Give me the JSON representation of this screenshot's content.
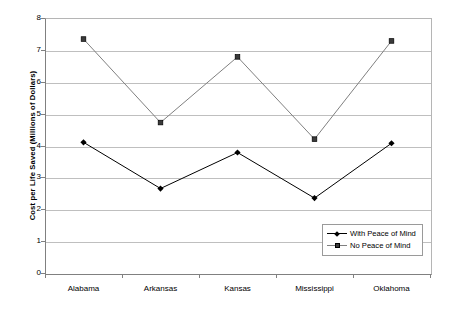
{
  "chart_data": {
    "type": "line",
    "title": "",
    "xlabel": "",
    "ylabel": "Cost per Life Saved (Millions of Dollars)",
    "categories": [
      "Alabama",
      "Arkansas",
      "Kansas",
      "Mississippi",
      "Oklahoma"
    ],
    "ylim": [
      0,
      8
    ],
    "yticks": [
      0,
      1,
      2,
      3,
      4,
      5,
      6,
      7,
      8
    ],
    "ytick_labels": [
      "0",
      "1",
      "2",
      "3",
      "4",
      "5",
      "6",
      "7",
      "8"
    ],
    "grid": true,
    "legend_position": "inside-bottom-right",
    "series": [
      {
        "name": "With Peace of Mind",
        "marker": "diamond",
        "color": "#000000",
        "values": [
          4.1,
          2.65,
          3.78,
          2.35,
          4.07
        ]
      },
      {
        "name": "No Peace of Mind",
        "marker": "square",
        "color": "#808080",
        "values": [
          7.34,
          4.72,
          6.78,
          4.2,
          7.28
        ]
      }
    ]
  },
  "axes": {
    "y_title": "Cost per Life Saved (Millions of Dollars)"
  },
  "legend": {
    "entries": [
      {
        "label": "With Peace of Mind"
      },
      {
        "label": "No Peace of Mind"
      }
    ]
  },
  "colors": {
    "series_with_peace": "#000000",
    "series_no_peace": "#808080",
    "gridline": "#bfbfbf",
    "axis": "#808080",
    "background": "#ffffff"
  }
}
